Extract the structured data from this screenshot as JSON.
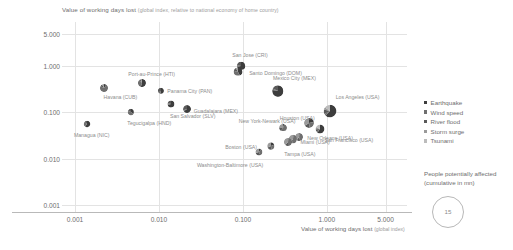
{
  "chart": {
    "title_main": "Value of working days lost",
    "title_sub": "(global index, relative to national economy of home country)",
    "xaxis_title_main": "Value of working days lost",
    "xaxis_title_sub": "(global index)"
  },
  "legend": {
    "items": [
      {
        "label": "Earthquake",
        "color": "#3d3d3d"
      },
      {
        "label": "Wind speed",
        "color": "#6f6f6f"
      },
      {
        "label": "River flood",
        "color": "#5a5a5a"
      },
      {
        "label": "Storm surge",
        "color": "#9a9a9a"
      },
      {
        "label": "Tsunami",
        "color": "#bcbcbc"
      }
    ]
  },
  "size_legend": {
    "caption": "People potentially affected (cumulative in mn)",
    "value": "15"
  },
  "chart_data": {
    "type": "scatter",
    "title": "Value of working days lost (global index, relative to national economy of home country)",
    "xlabel": "Value of working days lost (global index)",
    "ylabel": "Value of working days lost (global index, relative to national economy of home country)",
    "xscale": "log",
    "yscale": "log",
    "xlim": [
      0.0007,
      9.0
    ],
    "ylim": [
      0.0007,
      9.0
    ],
    "xticks": [
      "0.001",
      "0.010",
      "0.100",
      "1.000",
      "5.000"
    ],
    "xtick_values": [
      0.001,
      0.01,
      0.1,
      1.0,
      5.0
    ],
    "yticks": [
      "0.001",
      "0.010",
      "0.100",
      "1.000",
      "5.000"
    ],
    "ytick_values": [
      0.001,
      0.01,
      0.1,
      1.0,
      5.0
    ],
    "grid": true,
    "legend_position": "right",
    "size_encoding": "People potentially affected (cumulative in mn)",
    "size_reference": 15,
    "hazard_categories": [
      "Earthquake",
      "Wind speed",
      "River flood",
      "Storm surge",
      "Tsunami"
    ],
    "points": [
      {
        "name": "Havana (CUB)",
        "x": 0.0022,
        "y": 0.33,
        "size": 3.2,
        "shares": [
          0.1,
          0.72,
          0.1,
          0.08,
          0.0
        ]
      },
      {
        "name": "Port-au-Prince (HTI)",
        "x": 0.0062,
        "y": 0.43,
        "size": 3.4,
        "shares": [
          0.55,
          0.33,
          0.06,
          0.06,
          0.0
        ]
      },
      {
        "name": "Panama City (PAN)",
        "x": 0.0105,
        "y": 0.29,
        "size": 1.3,
        "shares": [
          0.55,
          0.2,
          0.25,
          0.0,
          0.0
        ]
      },
      {
        "name": "Guadalajara (MEX)",
        "x": 0.0215,
        "y": 0.12,
        "size": 3.0,
        "shares": [
          0.65,
          0.05,
          0.3,
          0.0,
          0.0
        ]
      },
      {
        "name": "San Salvador (SLV)",
        "x": 0.014,
        "y": 0.155,
        "size": 2.2,
        "shares": [
          0.7,
          0.1,
          0.2,
          0.0,
          0.0
        ]
      },
      {
        "name": "Tegucigalpa (HND)",
        "x": 0.0046,
        "y": 0.1,
        "size": 1.5,
        "shares": [
          0.35,
          0.45,
          0.2,
          0.0,
          0.0
        ]
      },
      {
        "name": "Managua (NIC)",
        "x": 0.0014,
        "y": 0.055,
        "size": 1.4,
        "shares": [
          0.6,
          0.25,
          0.15,
          0.0,
          0.0
        ]
      },
      {
        "name": "San Jose (CRI)",
        "x": 0.096,
        "y": 1.02,
        "size": 3.6,
        "shares": [
          0.72,
          0.06,
          0.22,
          0.0,
          0.0
        ]
      },
      {
        "name": "Santo Domingo (DOM)",
        "x": 0.088,
        "y": 0.76,
        "size": 4.4,
        "shares": [
          0.42,
          0.38,
          0.12,
          0.08,
          0.0
        ]
      },
      {
        "name": "Mexico City (MEX)",
        "x": 0.26,
        "y": 0.29,
        "size": 9.8,
        "shares": [
          0.78,
          0.04,
          0.18,
          0.0,
          0.0
        ]
      },
      {
        "name": "Los Angeles (USA)",
        "x": 1.1,
        "y": 0.105,
        "size": 12.5,
        "shares": [
          0.62,
          0.05,
          0.12,
          0.06,
          0.15
        ]
      },
      {
        "name": "New York-Newark (USA)",
        "x": 0.62,
        "y": 0.06,
        "size": 6.2,
        "shares": [
          0.22,
          0.26,
          0.18,
          0.34,
          0.0
        ]
      },
      {
        "name": "San Francisco (USA)",
        "x": 0.82,
        "y": 0.044,
        "size": 4.6,
        "shares": [
          0.6,
          0.04,
          0.1,
          0.08,
          0.18
        ]
      },
      {
        "name": "Houston (USA)",
        "x": 0.3,
        "y": 0.047,
        "size": 3.0,
        "shares": [
          0.05,
          0.55,
          0.15,
          0.25,
          0.0
        ]
      },
      {
        "name": "New Orleans (USA)",
        "x": 0.46,
        "y": 0.03,
        "size": 3.2,
        "shares": [
          0.03,
          0.42,
          0.15,
          0.4,
          0.0
        ]
      },
      {
        "name": "Miami (USA)",
        "x": 0.39,
        "y": 0.026,
        "size": 4.0,
        "shares": [
          0.02,
          0.5,
          0.1,
          0.38,
          0.0
        ]
      },
      {
        "name": "Tampa (USA)",
        "x": 0.34,
        "y": 0.023,
        "size": 3.4,
        "shares": [
          0.02,
          0.48,
          0.12,
          0.38,
          0.0
        ]
      },
      {
        "name": "Boston (USA)",
        "x": 0.215,
        "y": 0.0185,
        "size": 2.6,
        "shares": [
          0.18,
          0.3,
          0.2,
          0.32,
          0.0
        ]
      },
      {
        "name": "Washington-Baltimore (USA)",
        "x": 0.155,
        "y": 0.014,
        "size": 2.2,
        "shares": [
          0.1,
          0.34,
          0.26,
          0.3,
          0.0
        ]
      }
    ]
  }
}
